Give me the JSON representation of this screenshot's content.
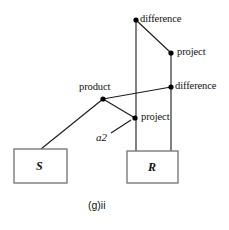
{
  "figure": {
    "caption": "(g)ii",
    "caption_x": 88,
    "caption_y": 199,
    "background_color": "#ffffff",
    "line_color": "#1a1a1a",
    "box_border_color": "#7a7a7a",
    "node_color": "#000000"
  },
  "boxes": [
    {
      "id": "box-s",
      "label": "S",
      "x": 14,
      "y": 149,
      "width": 53,
      "height": 34,
      "label_x": 36,
      "label_y": 159
    },
    {
      "id": "box-r",
      "label": "R",
      "x": 127,
      "y": 151,
      "width": 51,
      "height": 32,
      "label_x": 148,
      "label_y": 160
    }
  ],
  "nodes": [
    {
      "id": "node-difference-top",
      "label": "difference",
      "x": 136,
      "y": 20,
      "label_x": 140,
      "label_y": 13,
      "label_anchor": "right-of-node"
    },
    {
      "id": "node-project-upper",
      "label": "project",
      "x": 171,
      "y": 53,
      "label_x": 177,
      "label_y": 46,
      "label_anchor": "right-of-node"
    },
    {
      "id": "node-difference-right",
      "label": "difference",
      "x": 171,
      "y": 87,
      "label_x": 175,
      "label_y": 80,
      "label_anchor": "right-of-node"
    },
    {
      "id": "node-product",
      "label": "product",
      "x": 103,
      "y": 99,
      "label_x": 79,
      "label_y": 81,
      "label_anchor": "above-node"
    },
    {
      "id": "node-project-lower",
      "label": "project",
      "x": 135,
      "y": 118,
      "label_x": 141,
      "label_y": 111,
      "label_anchor": "right-of-node"
    }
  ],
  "annotations": [
    {
      "id": "annotation-a2",
      "label": "a2",
      "label_x": 96,
      "label_y": 131,
      "leader_x1": 111,
      "leader_y1": 133,
      "leader_x2": 131,
      "leader_y2": 120
    }
  ],
  "edges": [
    {
      "id": "edge-difftop-to-projupper",
      "x1": 136,
      "y1": 20,
      "x2": 171,
      "y2": 53
    },
    {
      "id": "edge-difftop-to-rbox",
      "x1": 136,
      "y1": 20,
      "x2": 136,
      "y2": 151
    },
    {
      "id": "edge-projupper-to-rbox",
      "x1": 171,
      "y1": 53,
      "x2": 171,
      "y2": 151
    },
    {
      "id": "edge-product-to-diffright",
      "x1": 103,
      "y1": 99,
      "x2": 171,
      "y2": 87
    },
    {
      "id": "edge-product-to-projlower",
      "x1": 103,
      "y1": 99,
      "x2": 135,
      "y2": 118
    },
    {
      "id": "edge-product-to-sbox",
      "x1": 103,
      "y1": 99,
      "x2": 41,
      "y2": 149
    }
  ]
}
